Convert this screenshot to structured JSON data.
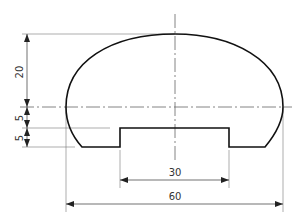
{
  "drawing": {
    "type": "technical cross-section profile",
    "dimensions": {
      "height_upper": "20",
      "height_middle": "5",
      "height_lower": "5",
      "notch_width": "30",
      "overall_width": "60"
    },
    "colors": {
      "outline": "#111111",
      "dimension_line": "#555555",
      "background": "#ffffff"
    }
  }
}
